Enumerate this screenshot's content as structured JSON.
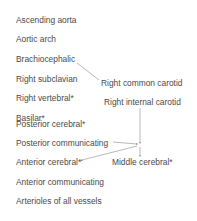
{
  "left_list": [
    "Ascending aorta",
    "Aortic arch",
    "Brachiocephalic",
    "Right subclavian",
    "Right vertebral*",
    "Basilar*",
    "Posterior cerebral*",
    "Posterior communicating",
    "Anterior cerebral*",
    "Anterior communicating",
    "Arterioles of all vessels"
  ],
  "right_labels": {
    "right_common_carotid": "Right common carotid",
    "right_internal_carotid": "Right internal carotid",
    "middle_cerebral": "Middle cerebral*"
  },
  "colors": {
    "text": "#4a4a4a",
    "line": "#888888"
  }
}
